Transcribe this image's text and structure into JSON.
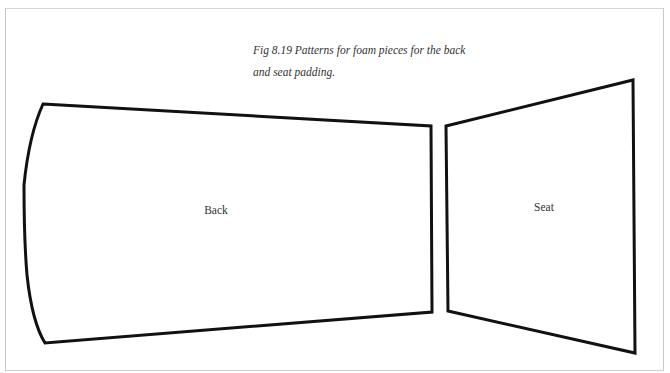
{
  "figure": {
    "caption_line1": "Fig 8.19 Patterns for foam pieces for the back",
    "caption_line2": "and seat padding.",
    "pieces": [
      {
        "label": "Back"
      },
      {
        "label": "Seat"
      }
    ]
  }
}
